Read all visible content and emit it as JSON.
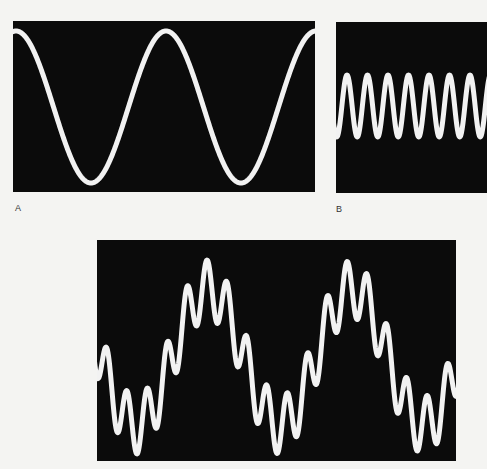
{
  "figure": {
    "panels": [
      {
        "id": "A",
        "label": "A",
        "description": "low-frequency sine wave"
      },
      {
        "id": "B",
        "label": "B",
        "description": "high-frequency sine wave"
      },
      {
        "id": "C",
        "label": "",
        "description": "sum of low- and high-frequency sine waves"
      }
    ],
    "colors": {
      "background": "#f4f4f2",
      "screen": "#0b0b0b",
      "trace": "#f2f2f2"
    }
  },
  "chart_data": [
    {
      "type": "line",
      "title": "A",
      "xlabel": "",
      "ylabel": "",
      "grid": false,
      "series": [
        {
          "name": "sine",
          "cycles_shown": 2,
          "relative_frequency": 1,
          "relative_amplitude": 1.0
        }
      ]
    },
    {
      "type": "line",
      "title": "B",
      "xlabel": "",
      "ylabel": "",
      "grid": false,
      "series": [
        {
          "name": "sine",
          "cycles_shown": 7.5,
          "relative_frequency": 7.3,
          "relative_amplitude": 0.4
        }
      ]
    },
    {
      "type": "line",
      "title": "",
      "xlabel": "",
      "ylabel": "",
      "grid": false,
      "series": [
        {
          "name": "low-frequency component",
          "cycles_shown": 2.5,
          "relative_frequency": 1,
          "relative_amplitude": 1.0
        },
        {
          "name": "high-frequency component",
          "cycles_shown": 18,
          "relative_frequency": 7.2,
          "relative_amplitude": 0.43
        }
      ]
    }
  ]
}
